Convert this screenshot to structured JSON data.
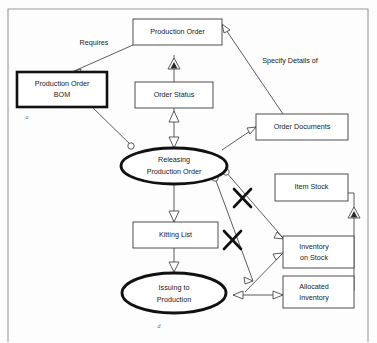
{
  "diagram": {
    "background_color": "#fdfdfd",
    "line_color": "#4a4a4a",
    "emphasis_color": "#111111",
    "nodes": [
      {
        "id": "production_order",
        "shape": "box",
        "label_line1": "Production Order",
        "label_line2": ""
      },
      {
        "id": "production_order_bom",
        "shape": "box-bold",
        "label_line1": "Production Order",
        "label_line2": "BOM"
      },
      {
        "id": "order_status",
        "shape": "box",
        "label_line1": "Order Status",
        "label_line2": ""
      },
      {
        "id": "order_documents",
        "shape": "box",
        "label_line1": "Order Documents",
        "label_line2": ""
      },
      {
        "id": "releasing_production_order",
        "shape": "ellipse-bold",
        "label_line1": "Releasing",
        "label_line2": "Production Order"
      },
      {
        "id": "kitting_list",
        "shape": "box",
        "label_line1": "Kitting List",
        "label_line2": ""
      },
      {
        "id": "issuing_to_production",
        "shape": "ellipse-bold",
        "label_line1": "Issuing to",
        "label_line2": "Production"
      },
      {
        "id": "item_stock",
        "shape": "box",
        "label_line1": "Item Stock",
        "label_line2": ""
      },
      {
        "id": "inventory_on_stock",
        "shape": "box",
        "label_line1": "Inventory",
        "label_line2": "on Stock"
      },
      {
        "id": "allocated_inventory",
        "shape": "box",
        "label_line1": "Allocated",
        "label_line2": "Inventory"
      }
    ],
    "edge_labels": [
      {
        "id": "requires",
        "text": "Requires"
      },
      {
        "id": "specify_details_of",
        "text": "Specify Details of"
      }
    ],
    "annotations": [
      {
        "id": "mark_bom",
        "text": "a"
      },
      {
        "id": "mark_issuing",
        "text": "d"
      }
    ],
    "crossed_out_relations": 2
  }
}
